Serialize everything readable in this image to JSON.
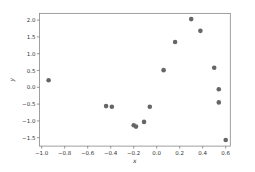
{
  "chart_data": {
    "type": "scatter",
    "title": "",
    "xlabel": "x",
    "ylabel": "y",
    "xlim": [
      -1.02,
      0.64
    ],
    "ylim": [
      -1.75,
      2.2
    ],
    "xticks": [
      -1.0,
      -0.8,
      -0.6,
      -0.4,
      -0.2,
      0.0,
      0.2,
      0.4,
      0.6
    ],
    "xtick_labels": [
      "−1.0",
      "−0.8",
      "−0.6",
      "−0.4",
      "−0.2",
      "0.0",
      "0.2",
      "0.4",
      "0.6"
    ],
    "yticks": [
      -1.5,
      -1.0,
      -0.5,
      0.0,
      0.5,
      1.0,
      1.5,
      2.0
    ],
    "ytick_labels": [
      "−1.5",
      "−1.0",
      "−0.5",
      "0.0",
      "0.5",
      "1.0",
      "1.5",
      "2.0"
    ],
    "grid": false,
    "legend": null,
    "marker_color": "#666666",
    "points": [
      {
        "x": -0.94,
        "y": 0.21
      },
      {
        "x": -0.44,
        "y": -0.56
      },
      {
        "x": -0.39,
        "y": -0.58
      },
      {
        "x": -0.2,
        "y": -1.13
      },
      {
        "x": -0.18,
        "y": -1.17
      },
      {
        "x": -0.11,
        "y": -1.03
      },
      {
        "x": -0.06,
        "y": -0.58
      },
      {
        "x": 0.06,
        "y": 0.51
      },
      {
        "x": 0.16,
        "y": 1.35
      },
      {
        "x": 0.3,
        "y": 2.03
      },
      {
        "x": 0.38,
        "y": 1.68
      },
      {
        "x": 0.5,
        "y": 0.58
      },
      {
        "x": 0.54,
        "y": -0.06
      },
      {
        "x": 0.54,
        "y": -0.45
      },
      {
        "x": 0.6,
        "y": -1.57
      }
    ]
  }
}
